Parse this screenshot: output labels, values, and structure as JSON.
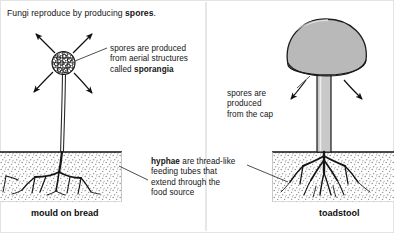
{
  "diagram": {
    "title": {
      "prefix": "Fungi reproduce by producing ",
      "emphasis": "spores",
      "suffix": "."
    },
    "panels": [
      {
        "id": "left",
        "caption": "mould on bread"
      },
      {
        "id": "right",
        "caption": "toadstool"
      }
    ],
    "labels": {
      "sporangia": {
        "line1": "spores are produced",
        "line2": "from aerial structures",
        "line3_prefix": "called ",
        "line3_emphasis": "sporangia"
      },
      "cap": {
        "line1": "spores are",
        "line2": "produced",
        "line3": "from the cap"
      },
      "hyphae": {
        "line1_emphasis": "hyphae",
        "line1_suffix": " are thread-like",
        "line2": "feeding tubes that",
        "line3": "extend through the",
        "line4": "food source"
      }
    },
    "colors": {
      "ink": "#111111",
      "cap_fill": "#b9b9b9",
      "stipe_fill": "#c9c9c9",
      "soil_dot": "#8f8f8f",
      "background": "#ffffff"
    }
  }
}
